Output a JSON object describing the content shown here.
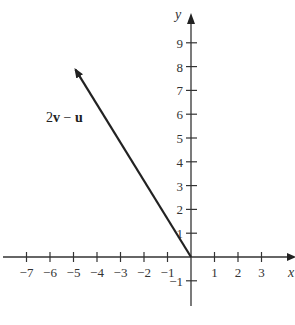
{
  "chart_data": {
    "type": "line",
    "title": "",
    "xlabel": "x",
    "ylabel": "y",
    "xlim": [
      -7.5,
      4.3
    ],
    "ylim": [
      -2,
      10.2
    ],
    "x_ticks": [
      -7,
      -6,
      -5,
      -4,
      -3,
      -2,
      -1,
      1,
      2,
      3
    ],
    "y_ticks": [
      9,
      8,
      7,
      6,
      5,
      4,
      3,
      2,
      1,
      -1
    ],
    "x_tick_labels": [
      "−7",
      "−6",
      "−5",
      "−4",
      "−3",
      "−2",
      "−1",
      "1",
      "2",
      "3"
    ],
    "y_tick_labels": [
      "9",
      "8",
      "7",
      "6",
      "5",
      "4",
      "3",
      "2",
      "1",
      "−1"
    ],
    "grid": false,
    "series": [
      {
        "name": "2v − u",
        "kind": "vector",
        "from": [
          0,
          0
        ],
        "to": [
          -5,
          8
        ],
        "label_bold_parts": [
          "v",
          "u"
        ]
      }
    ],
    "annotations": [
      {
        "text": "2v − u",
        "near": [
          -6.2,
          5.8
        ]
      }
    ]
  },
  "labels": {
    "x_axis": "x",
    "y_axis": "y",
    "vector": {
      "prefix": "2",
      "v": "v",
      "op": " − ",
      "u": "u"
    }
  }
}
